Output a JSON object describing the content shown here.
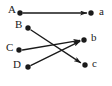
{
  "figure": {
    "type": "directed-graph",
    "background_color": "#ffffff",
    "ink_color": "#1a1a1a",
    "width": 112,
    "height": 86,
    "dot_radius": 2.6,
    "edge_width": 1.3
  },
  "nodes": [
    {
      "id": "A",
      "label": "A",
      "side": "left",
      "dot_x": 20,
      "dot_y": 13,
      "label_x": 8,
      "label_y": 5
    },
    {
      "id": "B",
      "label": "B",
      "side": "left",
      "dot_x": 28,
      "dot_y": 28,
      "label_x": 15,
      "label_y": 20
    },
    {
      "id": "C",
      "label": "C",
      "side": "left",
      "dot_x": 19,
      "dot_y": 50,
      "label_x": 6,
      "label_y": 42
    },
    {
      "id": "D",
      "label": "D",
      "side": "left",
      "dot_x": 28,
      "dot_y": 67,
      "label_x": 13,
      "label_y": 59
    },
    {
      "id": "a",
      "label": "a",
      "side": "right",
      "dot_x": 91,
      "dot_y": 13,
      "label_x": 99,
      "label_y": 6
    },
    {
      "id": "b",
      "label": "b",
      "side": "right",
      "dot_x": 84,
      "dot_y": 40,
      "label_x": 91,
      "label_y": 32
    },
    {
      "id": "c",
      "label": "c",
      "side": "right",
      "dot_x": 85,
      "dot_y": 65,
      "label_x": 92,
      "label_y": 58
    }
  ],
  "edges": [
    {
      "id": "A-a",
      "from": "A",
      "to": "a",
      "x1": 23,
      "y1": 13,
      "x2": 87,
      "y2": 13,
      "directed": true
    },
    {
      "id": "B-c",
      "from": "B",
      "to": "c",
      "x1": 31,
      "y1": 30,
      "x2": 81,
      "y2": 63,
      "directed": true
    },
    {
      "id": "C-b",
      "from": "C",
      "to": "b",
      "x1": 23,
      "y1": 50,
      "x2": 80,
      "y2": 40,
      "directed": true
    },
    {
      "id": "D-b",
      "from": "D",
      "to": "b",
      "x1": 31,
      "y1": 65,
      "x2": 80,
      "y2": 41,
      "directed": true
    }
  ],
  "edge_list_text": [
    "A → a",
    "B → c",
    "C → b",
    "D → b"
  ]
}
